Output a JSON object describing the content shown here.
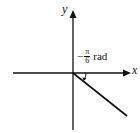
{
  "diagram": {
    "axes": {
      "x_label": "x",
      "y_label": "y"
    },
    "angle": {
      "sign": "−",
      "numerator": "π",
      "denominator": "6",
      "unit": "rad"
    },
    "colors": {
      "stroke": "#111111",
      "background": "#ffffff"
    }
  }
}
